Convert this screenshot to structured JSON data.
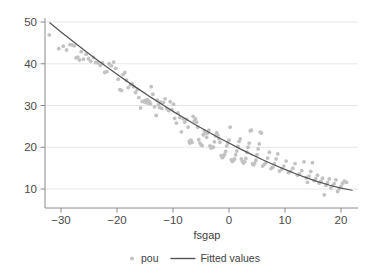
{
  "chart_data": {
    "type": "scatter",
    "title": "",
    "subtitle": "",
    "xlabel": "fsgap",
    "ylabel": "",
    "xlim": [
      -33.5,
      22.5
    ],
    "ylim": [
      7.2,
      50.8
    ],
    "xticks": [
      -30,
      -20,
      -10,
      0,
      10,
      20
    ],
    "xtick_labels": [
      "-30",
      "-20",
      "-10",
      "0",
      "10",
      "20"
    ],
    "yticks": [
      10,
      20,
      30,
      40,
      50
    ],
    "ytick_labels": [
      "10",
      "20",
      "30",
      "40",
      "50"
    ],
    "grid": "horizontal",
    "legend_position": "bottom-outside",
    "marker_color": "#c2c2c2",
    "line_color": "#555555",
    "grid_color": "#e3e3e3",
    "axis_color": "#8a8a8a",
    "series": [
      {
        "name": "pou",
        "type": "scatter",
        "marker": "circle",
        "points": [
          [
            -32.1,
            46.9
          ],
          [
            -30.4,
            43.6
          ],
          [
            -29.6,
            44.2
          ],
          [
            -29.0,
            43.3
          ],
          [
            -28.4,
            44.6
          ],
          [
            -28.0,
            44.5
          ],
          [
            -27.6,
            44.3
          ],
          [
            -27.3,
            41.4
          ],
          [
            -27.0,
            41.6
          ],
          [
            -26.7,
            40.9
          ],
          [
            -26.4,
            42.9
          ],
          [
            -26.0,
            41.1
          ],
          [
            -25.5,
            42.3
          ],
          [
            -25.1,
            41.2
          ],
          [
            -24.7,
            40.6
          ],
          [
            -24.2,
            41.5
          ],
          [
            -23.8,
            40.3
          ],
          [
            -23.4,
            40.2
          ],
          [
            -23.0,
            39.6
          ],
          [
            -22.6,
            40.2
          ],
          [
            -22.2,
            37.9
          ],
          [
            -21.8,
            38.1
          ],
          [
            -21.4,
            40.0
          ],
          [
            -21.0,
            39.5
          ],
          [
            -20.6,
            40.4
          ],
          [
            -20.2,
            38.9
          ],
          [
            -19.8,
            36.3
          ],
          [
            -19.5,
            33.8
          ],
          [
            -19.2,
            33.6
          ],
          [
            -18.9,
            37.4
          ],
          [
            -18.6,
            37.9
          ],
          [
            -18.3,
            36.1
          ],
          [
            -18.0,
            34.3
          ],
          [
            -17.6,
            35.0
          ],
          [
            -17.3,
            35.2
          ],
          [
            -17.0,
            34.5
          ],
          [
            -16.7,
            33.1
          ],
          [
            -16.4,
            33.8
          ],
          [
            -16.1,
            31.9
          ],
          [
            -15.8,
            29.4
          ],
          [
            -15.5,
            31.0
          ],
          [
            -15.2,
            30.9
          ],
          [
            -15.0,
            31.2
          ],
          [
            -14.8,
            30.7
          ],
          [
            -14.6,
            31.4
          ],
          [
            -14.4,
            30.6
          ],
          [
            -14.2,
            31.0
          ],
          [
            -14.0,
            30.4
          ],
          [
            -13.9,
            34.5
          ],
          [
            -13.6,
            32.7
          ],
          [
            -13.3,
            29.7
          ],
          [
            -13.0,
            27.6
          ],
          [
            -12.8,
            31.3
          ],
          [
            -12.6,
            30.2
          ],
          [
            -12.4,
            29.5
          ],
          [
            -12.2,
            30.8
          ],
          [
            -12.0,
            29.3
          ],
          [
            -11.7,
            30.7
          ],
          [
            -11.4,
            31.6
          ],
          [
            -11.1,
            29.3
          ],
          [
            -10.8,
            28.8
          ],
          [
            -10.5,
            30.9
          ],
          [
            -10.2,
            29.0
          ],
          [
            -9.9,
            30.3
          ],
          [
            -9.7,
            26.9
          ],
          [
            -9.4,
            25.8
          ],
          [
            -9.1,
            28.2
          ],
          [
            -8.8,
            27.1
          ],
          [
            -8.5,
            23.7
          ],
          [
            -8.2,
            26.8
          ],
          [
            -7.9,
            26.0
          ],
          [
            -7.6,
            26.7
          ],
          [
            -7.3,
            24.8
          ],
          [
            -7.1,
            21.4
          ],
          [
            -7.0,
            21.0
          ],
          [
            -6.8,
            21.7
          ],
          [
            -6.6,
            21.2
          ],
          [
            -6.4,
            27.4
          ],
          [
            -6.2,
            26.3
          ],
          [
            -6.0,
            26.8
          ],
          [
            -5.8,
            26.0
          ],
          [
            -5.6,
            24.8
          ],
          [
            -5.4,
            21.8
          ],
          [
            -5.2,
            21.0
          ],
          [
            -5.0,
            20.6
          ],
          [
            -4.8,
            20.4
          ],
          [
            -4.6,
            23.0
          ],
          [
            -4.4,
            24.0
          ],
          [
            -4.2,
            23.4
          ],
          [
            -4.0,
            22.4
          ],
          [
            -3.8,
            23.4
          ],
          [
            -3.6,
            24.1
          ],
          [
            -3.4,
            20.3
          ],
          [
            -3.2,
            19.8
          ],
          [
            -3.0,
            20.1
          ],
          [
            -2.8,
            20.0
          ],
          [
            -2.6,
            21.3
          ],
          [
            -2.4,
            22.7
          ],
          [
            -2.2,
            23.5
          ],
          [
            -2.0,
            22.9
          ],
          [
            -1.8,
            22.1
          ],
          [
            -1.6,
            21.2
          ],
          [
            -1.4,
            18.0
          ],
          [
            -1.2,
            17.5
          ],
          [
            -1.0,
            17.8
          ],
          [
            -0.8,
            18.3
          ],
          [
            -0.6,
            19.0
          ],
          [
            -0.4,
            20.3
          ],
          [
            -0.2,
            21.0
          ],
          [
            0.0,
            21.7
          ],
          [
            0.2,
            24.8
          ],
          [
            0.4,
            17.0
          ],
          [
            0.6,
            16.6
          ],
          [
            0.8,
            16.9
          ],
          [
            1.0,
            17.2
          ],
          [
            1.2,
            18.2
          ],
          [
            1.4,
            19.1
          ],
          [
            1.6,
            20.2
          ],
          [
            1.8,
            21.4
          ],
          [
            2.0,
            22.0
          ],
          [
            2.2,
            17.2
          ],
          [
            2.4,
            16.6
          ],
          [
            2.6,
            16.2
          ],
          [
            2.8,
            16.5
          ],
          [
            3.0,
            17.3
          ],
          [
            3.2,
            18.8
          ],
          [
            3.4,
            20.0
          ],
          [
            3.6,
            21.0
          ],
          [
            3.8,
            23.9
          ],
          [
            4.0,
            24.1
          ],
          [
            4.2,
            16.0
          ],
          [
            4.4,
            15.8
          ],
          [
            4.6,
            16.2
          ],
          [
            4.8,
            16.9
          ],
          [
            5.0,
            18.2
          ],
          [
            5.2,
            19.6
          ],
          [
            5.4,
            20.8
          ],
          [
            5.6,
            23.6
          ],
          [
            5.8,
            23.4
          ],
          [
            6.0,
            15.5
          ],
          [
            6.3,
            15.9
          ],
          [
            6.6,
            16.3
          ],
          [
            6.9,
            17.4
          ],
          [
            7.2,
            18.8
          ],
          [
            7.5,
            14.9
          ],
          [
            7.8,
            15.2
          ],
          [
            8.1,
            16.0
          ],
          [
            8.4,
            17.2
          ],
          [
            8.7,
            18.4
          ],
          [
            9.0,
            14.3
          ],
          [
            9.4,
            14.7
          ],
          [
            9.8,
            15.5
          ],
          [
            10.2,
            16.7
          ],
          [
            10.6,
            13.9
          ],
          [
            11.0,
            14.2
          ],
          [
            11.4,
            15.0
          ],
          [
            11.8,
            16.1
          ],
          [
            12.2,
            13.3
          ],
          [
            12.6,
            13.6
          ],
          [
            13.0,
            14.4
          ],
          [
            13.4,
            16.5
          ],
          [
            13.8,
            12.7
          ],
          [
            14.0,
            11.6
          ],
          [
            14.3,
            13.1
          ],
          [
            14.6,
            14.2
          ],
          [
            14.9,
            16.3
          ],
          [
            15.2,
            12.0
          ],
          [
            15.5,
            12.5
          ],
          [
            15.8,
            13.3
          ],
          [
            16.1,
            11.4
          ],
          [
            16.4,
            11.8
          ],
          [
            16.7,
            12.6
          ],
          [
            17.0,
            8.6
          ],
          [
            17.3,
            10.9
          ],
          [
            17.6,
            11.5
          ],
          [
            17.9,
            12.4
          ],
          [
            18.2,
            10.3
          ],
          [
            18.5,
            10.8
          ],
          [
            18.8,
            11.3
          ],
          [
            19.1,
            12.2
          ],
          [
            19.4,
            9.4
          ],
          [
            19.7,
            10.1
          ],
          [
            20.0,
            10.6
          ],
          [
            20.3,
            11.4
          ],
          [
            20.6,
            11.9
          ],
          [
            21.0,
            11.6
          ]
        ]
      },
      {
        "name": "Fitted values",
        "type": "line",
        "points": [
          [
            -32.0,
            49.8
          ],
          [
            -30.0,
            47.6
          ],
          [
            -28.0,
            45.5
          ],
          [
            -26.0,
            43.4
          ],
          [
            -24.0,
            41.4
          ],
          [
            -22.0,
            39.4
          ],
          [
            -20.0,
            37.5
          ],
          [
            -18.0,
            35.6
          ],
          [
            -16.0,
            33.8
          ],
          [
            -14.0,
            32.0
          ],
          [
            -12.0,
            30.3
          ],
          [
            -10.0,
            28.6
          ],
          [
            -8.0,
            27.0
          ],
          [
            -6.0,
            25.4
          ],
          [
            -4.0,
            23.9
          ],
          [
            -2.0,
            22.4
          ],
          [
            0.0,
            21.0
          ],
          [
            2.0,
            19.6
          ],
          [
            4.0,
            18.3
          ],
          [
            6.0,
            17.0
          ],
          [
            8.0,
            15.8
          ],
          [
            10.0,
            14.7
          ],
          [
            12.0,
            13.6
          ],
          [
            14.0,
            12.6
          ],
          [
            16.0,
            11.7
          ],
          [
            18.0,
            10.9
          ],
          [
            20.0,
            10.2
          ],
          [
            22.0,
            9.7
          ]
        ]
      }
    ],
    "legend": [
      {
        "label": "pou",
        "marker": "dot",
        "color": "#c2c2c2"
      },
      {
        "label": "Fitted values",
        "marker": "line",
        "color": "#555555"
      }
    ]
  }
}
